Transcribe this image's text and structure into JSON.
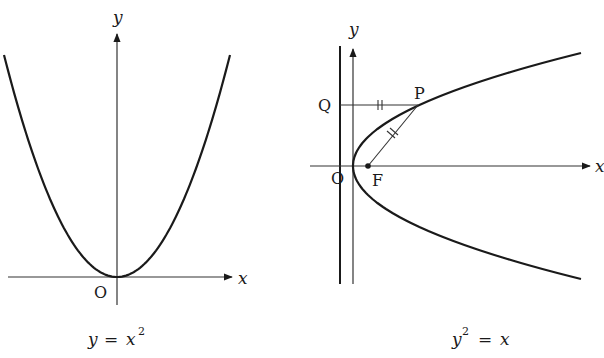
{
  "colors": {
    "curve": "#1a1a1a",
    "axis": "#333333",
    "background": "#ffffff"
  },
  "left_diagram": {
    "axis_x_label": "x",
    "axis_y_label": "y",
    "origin_label": "O",
    "caption": {
      "lhs": "y",
      "eq": "=",
      "rhs_base": "x",
      "rhs_exp": "2"
    },
    "equation": "y = x^2"
  },
  "right_diagram": {
    "axis_x_label": "x",
    "axis_y_label": "y",
    "origin_label": "O",
    "point_p_label": "P",
    "point_q_label": "Q",
    "focus_label": "F",
    "caption": {
      "lhs_base": "y",
      "lhs_exp": "2",
      "eq": "=",
      "rhs": "x"
    },
    "equation": "y^2 = x",
    "annotations": [
      "directrix line (vertical, left of y-axis)",
      "QP = PF (equal-length tick marks)"
    ]
  }
}
